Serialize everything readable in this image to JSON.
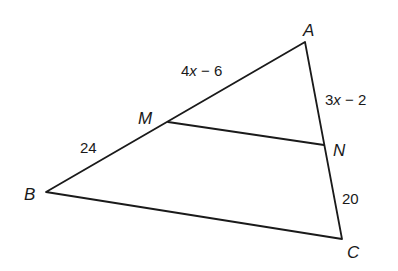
{
  "figure": {
    "type": "triangle-with-midsegment",
    "vertices": {
      "A": {
        "label": "A",
        "x": 305,
        "y": 42
      },
      "B": {
        "label": "B",
        "x": 46,
        "y": 192
      },
      "C": {
        "label": "C",
        "x": 342,
        "y": 239
      },
      "M": {
        "label": "M",
        "x": 168,
        "y": 122
      },
      "N": {
        "label": "N",
        "x": 324,
        "y": 145
      }
    },
    "segments": {
      "AM": {
        "label_pre": "4",
        "label_var": "x",
        "label_post": " − 6"
      },
      "AN": {
        "label_pre": "3",
        "label_var": "x",
        "label_post": " − 2"
      },
      "MB": {
        "label": "24"
      },
      "NC": {
        "label": "20"
      }
    },
    "colors": {
      "stroke": "#1a1a1a",
      "background": "#ffffff"
    }
  }
}
